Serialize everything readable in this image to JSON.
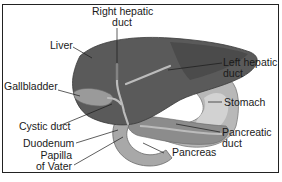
{
  "diagram": {
    "labels": {
      "right_hepatic_duct_1": "Right hepatic",
      "right_hepatic_duct_2": "duct",
      "liver": "Liver",
      "left_hepatic_duct_1": "Left hepatic",
      "left_hepatic_duct_2": "duct",
      "gallbladder": "Gallbladder",
      "stomach": "Stomach",
      "cystic_duct": "Cystic duct",
      "pancreatic_duct_1": "Pancreatic",
      "pancreatic_duct_2": "duct",
      "duodenum": "Duodenum",
      "pancreas": "Pancreas",
      "papilla_1": "Papilla",
      "papilla_2": "of Vater"
    },
    "colors": {
      "liver": "#5a5a5a",
      "liver_dark": "#454545",
      "gallbladder": "#9a9a9a",
      "stomach": "#b8b8b8",
      "stomach_inner": "#d2d2d2",
      "pancreas": "#8c8c8c",
      "duodenum": "#a8a8a8",
      "duct": "#bcbcbc",
      "leader": "#1a1a1a",
      "border": "#222222"
    }
  }
}
